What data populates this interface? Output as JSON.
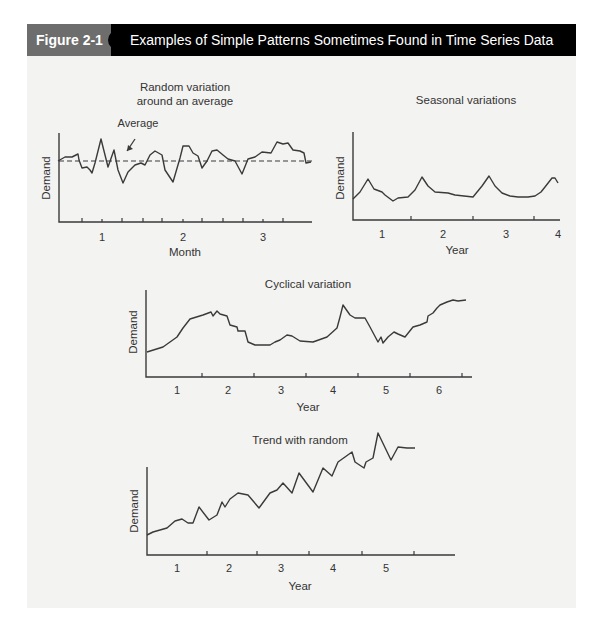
{
  "header": {
    "figure_label": "Figure 2-1",
    "title": "Examples of Simple Patterns Sometimes Found in Time Series Data",
    "label_color": "#6d6d6d",
    "bar_color": "#000000"
  },
  "chart_data": [
    {
      "type": "line",
      "title": "Random variation around an average",
      "title_lines": [
        "Random variation",
        "around an average"
      ],
      "xlabel": "Month",
      "ylabel": "Demand",
      "xticks": [
        "1",
        "2",
        "3"
      ],
      "annotation": "Average",
      "average_line": true,
      "grid": false,
      "frame": {
        "x0": 59,
        "y0": 222,
        "x1": 312,
        "ytop": 133,
        "avg_y": 161
      },
      "tick_x": [
        102,
        183,
        263
      ],
      "minor_ticks": [
        82,
        122,
        143,
        162,
        202,
        223,
        243,
        283
      ],
      "label_y": 241,
      "xlabel_pos": [
        185,
        256
      ],
      "ylabel_pos": [
        50,
        178
      ],
      "title_pos": [
        185,
        91
      ],
      "annotation_pos": [
        138,
        127
      ],
      "arrow": [
        135,
        139,
        127,
        151
      ],
      "points": [
        [
          58,
          161
        ],
        [
          65,
          157
        ],
        [
          68,
          157
        ],
        [
          72,
          157
        ],
        [
          78,
          154
        ],
        [
          79,
          160
        ],
        [
          82,
          168
        ],
        [
          87,
          167
        ],
        [
          90,
          170
        ],
        [
          92,
          173
        ],
        [
          95,
          163
        ],
        [
          101,
          139
        ],
        [
          108,
          167
        ],
        [
          114,
          150
        ],
        [
          118,
          170
        ],
        [
          123,
          183
        ],
        [
          128,
          172
        ],
        [
          135,
          165
        ],
        [
          141,
          163
        ],
        [
          145,
          165
        ],
        [
          150,
          155
        ],
        [
          155,
          151
        ],
        [
          162,
          155
        ],
        [
          165,
          170
        ],
        [
          173,
          182
        ],
        [
          180,
          158
        ],
        [
          183,
          146
        ],
        [
          189,
          146
        ],
        [
          193,
          153
        ],
        [
          198,
          156
        ],
        [
          202,
          168
        ],
        [
          207,
          161
        ],
        [
          212,
          151
        ],
        [
          217,
          150
        ],
        [
          223,
          155
        ],
        [
          228,
          159
        ],
        [
          235,
          161
        ],
        [
          242,
          174
        ],
        [
          248,
          159
        ],
        [
          255,
          157
        ],
        [
          262,
          152
        ],
        [
          271,
          153
        ],
        [
          277,
          142
        ],
        [
          283,
          144
        ],
        [
          288,
          143
        ],
        [
          293,
          150
        ],
        [
          300,
          151
        ],
        [
          304,
          153
        ],
        [
          306,
          163
        ],
        [
          311,
          162
        ]
      ]
    },
    {
      "type": "line",
      "title": "Seasonal variations",
      "title_lines": [
        "Seasonal variations"
      ],
      "xlabel": "Year",
      "ylabel": "Demand",
      "xticks": [
        "1",
        "2",
        "3",
        "4"
      ],
      "grid": false,
      "frame": {
        "x0": 353,
        "y0": 220,
        "x1": 560,
        "ytop": 132
      },
      "tick_x": [
        382,
        443,
        506,
        558
      ],
      "minor_ticks": [
        411,
        473,
        534
      ],
      "label_y": 238,
      "xlabel_pos": [
        457,
        254
      ],
      "ylabel_pos": [
        344,
        178
      ],
      "title_pos": [
        466,
        104
      ],
      "points": [
        [
          353,
          199
        ],
        [
          360,
          192
        ],
        [
          368,
          179
        ],
        [
          374,
          189
        ],
        [
          382,
          192
        ],
        [
          385,
          195
        ],
        [
          393,
          201
        ],
        [
          398,
          198
        ],
        [
          408,
          197
        ],
        [
          415,
          190
        ],
        [
          422,
          177
        ],
        [
          428,
          186
        ],
        [
          435,
          192
        ],
        [
          448,
          193
        ],
        [
          455,
          195
        ],
        [
          473,
          197
        ],
        [
          482,
          186
        ],
        [
          489,
          176
        ],
        [
          495,
          186
        ],
        [
          502,
          193
        ],
        [
          510,
          196
        ],
        [
          518,
          197
        ],
        [
          528,
          197
        ],
        [
          535,
          196
        ],
        [
          541,
          192
        ],
        [
          545,
          187
        ],
        [
          552,
          178
        ],
        [
          555,
          178
        ],
        [
          558,
          183
        ]
      ]
    },
    {
      "type": "line",
      "title": "Cyclical variation",
      "title_lines": [
        "Cyclical variation"
      ],
      "xlabel": "Year",
      "ylabel": "Demand",
      "xticks": [
        "1",
        "2",
        "3",
        "4",
        "5",
        "6"
      ],
      "grid": false,
      "frame": {
        "x0": 146,
        "y0": 377,
        "x1": 472,
        "ytop": 290
      },
      "tick_x": [
        177,
        228,
        281,
        333,
        386,
        439
      ],
      "minor_ticks": [
        202,
        254,
        306,
        358,
        410,
        462
      ],
      "label_y": 394,
      "xlabel_pos": [
        308,
        411
      ],
      "ylabel_pos": [
        137,
        332
      ],
      "title_pos": [
        308,
        288
      ],
      "points": [
        [
          147,
          352
        ],
        [
          163,
          347
        ],
        [
          177,
          337
        ],
        [
          183,
          328
        ],
        [
          190,
          319
        ],
        [
          203,
          315
        ],
        [
          211,
          312
        ],
        [
          213,
          316
        ],
        [
          217,
          311
        ],
        [
          220,
          314
        ],
        [
          227,
          316
        ],
        [
          230,
          325
        ],
        [
          237,
          327
        ],
        [
          238,
          331
        ],
        [
          245,
          331
        ],
        [
          248,
          342
        ],
        [
          255,
          345
        ],
        [
          270,
          345
        ],
        [
          275,
          342
        ],
        [
          280,
          340
        ],
        [
          287,
          335
        ],
        [
          292,
          336
        ],
        [
          300,
          341
        ],
        [
          313,
          342
        ],
        [
          327,
          337
        ],
        [
          337,
          328
        ],
        [
          340,
          317
        ],
        [
          343,
          305
        ],
        [
          350,
          315
        ],
        [
          355,
          318
        ],
        [
          365,
          318
        ],
        [
          370,
          327
        ],
        [
          378,
          342
        ],
        [
          381,
          337
        ],
        [
          383,
          343
        ],
        [
          388,
          337
        ],
        [
          394,
          332
        ],
        [
          398,
          334
        ],
        [
          405,
          337
        ],
        [
          413,
          327
        ],
        [
          420,
          325
        ],
        [
          427,
          322
        ],
        [
          428,
          316
        ],
        [
          433,
          313
        ],
        [
          437,
          308
        ],
        [
          440,
          305
        ],
        [
          447,
          302
        ],
        [
          453,
          300
        ],
        [
          458,
          301
        ],
        [
          466,
          300
        ]
      ]
    },
    {
      "type": "line",
      "title": "Trend with random",
      "title_lines": [
        "Trend with random"
      ],
      "xlabel": "Year",
      "ylabel": "Demand",
      "xticks": [
        "1",
        "2",
        "3",
        "4",
        "5"
      ],
      "grid": false,
      "frame": {
        "x0": 147,
        "y0": 555,
        "x1": 455,
        "ytop": 467
      },
      "tick_x": [
        177,
        229,
        281,
        333,
        386
      ],
      "minor_ticks": [
        207,
        257,
        309,
        362,
        414
      ],
      "label_y": 572,
      "xlabel_pos": [
        300,
        590
      ],
      "ylabel_pos": [
        138,
        511
      ],
      "title_pos": [
        300,
        444
      ],
      "points": [
        [
          147,
          535
        ],
        [
          153,
          532
        ],
        [
          167,
          528
        ],
        [
          175,
          521
        ],
        [
          182,
          519
        ],
        [
          188,
          523
        ],
        [
          193,
          523
        ],
        [
          199,
          507
        ],
        [
          209,
          520
        ],
        [
          217,
          515
        ],
        [
          222,
          502
        ],
        [
          225,
          507
        ],
        [
          230,
          499
        ],
        [
          238,
          493
        ],
        [
          248,
          495
        ],
        [
          259,
          508
        ],
        [
          270,
          493
        ],
        [
          277,
          490
        ],
        [
          283,
          483
        ],
        [
          292,
          493
        ],
        [
          299,
          473
        ],
        [
          313,
          492
        ],
        [
          323,
          468
        ],
        [
          332,
          476
        ],
        [
          338,
          462
        ],
        [
          352,
          452
        ],
        [
          355,
          462
        ],
        [
          364,
          468
        ],
        [
          366,
          462
        ],
        [
          373,
          458
        ],
        [
          378,
          433
        ],
        [
          391,
          460
        ],
        [
          398,
          447
        ],
        [
          407,
          448
        ],
        [
          415,
          448
        ]
      ]
    }
  ]
}
